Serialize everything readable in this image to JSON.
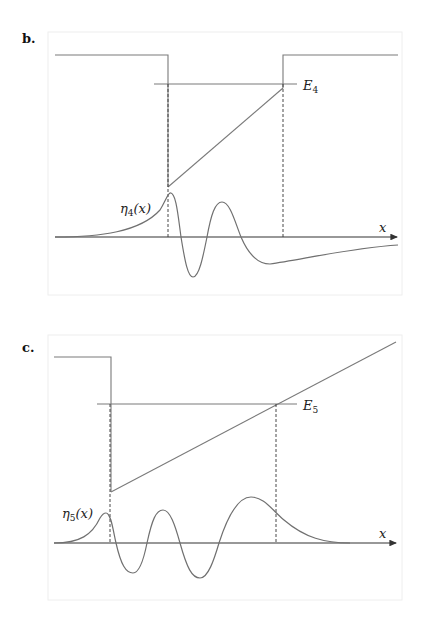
{
  "panels": [
    {
      "label": "b.",
      "energy_label": "E",
      "energy_sub": "4",
      "wave_label_main": "η",
      "wave_label_sub": "4",
      "wave_label_arg": "(x)",
      "axis_label": "x"
    },
    {
      "label": "c.",
      "energy_label": "E",
      "energy_sub": "5",
      "wave_label_main": "η",
      "wave_label_sub": "5",
      "wave_label_arg": "(x)",
      "axis_label": "x"
    }
  ],
  "colors": {
    "curve": "#707070",
    "axis": "#333333",
    "frame": "#eeeeee"
  }
}
